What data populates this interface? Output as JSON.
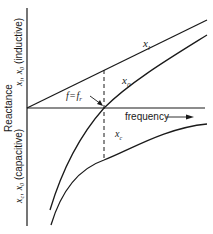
{
  "diagram": {
    "y_axis_label": "Reactance",
    "y_axis_upper_label": "x_l, x_0 (inductive)",
    "y_axis_upper_vars": "x",
    "y_axis_upper_var1_sub": "l",
    "y_axis_upper_var2_sub": "0",
    "y_axis_upper_text": "(inductive)",
    "y_axis_lower_label": "x_c, x_0 (capacitive)",
    "y_axis_lower_var1_sub": "c",
    "y_axis_lower_var2_sub": "0",
    "y_axis_lower_text": "(capacitive)",
    "x_axis_label": "frequency",
    "resonance_label": "f = f_r",
    "resonance_lhs": "f",
    "resonance_eq": "=",
    "resonance_rhs": "f",
    "resonance_rhs_sub": "r",
    "curves": [
      {
        "name": "x_l",
        "var": "x",
        "sub": "l",
        "description": "inductive reactance, straight line increasing with frequency"
      },
      {
        "name": "x_0",
        "var": "x",
        "sub": "0",
        "description": "net reactance, crosses zero at resonance"
      },
      {
        "name": "x_c",
        "var": "x",
        "sub": "c",
        "description": "capacitive reactance, negative hyperbola approaching zero"
      }
    ],
    "colors": {
      "line": "#1a1a1a",
      "background": "#ffffff"
    }
  }
}
